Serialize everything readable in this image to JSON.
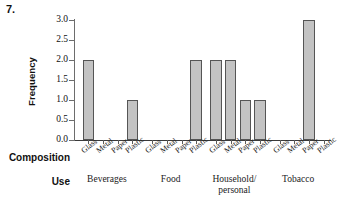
{
  "figure": {
    "number": "7."
  },
  "axes": {
    "y_title": "Frequency",
    "y_ticks": [
      "0.0",
      "0.5",
      "1.0",
      "1.5",
      "2.0",
      "2.5",
      "3.0"
    ],
    "row_label_composition": "Composition",
    "row_label_use": "Use"
  },
  "chart_data": {
    "type": "bar",
    "title": "",
    "xlabel": "Composition / Use",
    "ylabel": "Frequency",
    "ylim": [
      0,
      3.0
    ],
    "ytick_step": 0.5,
    "grid": false,
    "legend": "none",
    "bar_fill_color": "#c3c3c3",
    "bar_edge_color": "#555555",
    "categories": [
      "Glass",
      "Metal",
      "Paper",
      "Plastic"
    ],
    "groups": [
      "Beverages",
      "Food",
      "Household/personal",
      "Tobacco"
    ],
    "group_label_lines": [
      [
        "Beverages"
      ],
      [
        "Food"
      ],
      [
        "Household/",
        "personal"
      ],
      [
        "Tobacco"
      ]
    ],
    "series": [
      {
        "name": "Beverages",
        "values": [
          2,
          0,
          0,
          1
        ]
      },
      {
        "name": "Food",
        "values": [
          0,
          0,
          0,
          2
        ]
      },
      {
        "name": "Household/personal",
        "values": [
          2,
          2,
          1,
          1
        ]
      },
      {
        "name": "Tobacco",
        "values": [
          0,
          0,
          3,
          0
        ]
      }
    ],
    "points": [
      {
        "use": "Beverages",
        "composition": "Glass",
        "frequency": 2
      },
      {
        "use": "Beverages",
        "composition": "Metal",
        "frequency": 0
      },
      {
        "use": "Beverages",
        "composition": "Paper",
        "frequency": 0
      },
      {
        "use": "Beverages",
        "composition": "Plastic",
        "frequency": 1
      },
      {
        "use": "Food",
        "composition": "Glass",
        "frequency": 0
      },
      {
        "use": "Food",
        "composition": "Metal",
        "frequency": 0
      },
      {
        "use": "Food",
        "composition": "Paper",
        "frequency": 0
      },
      {
        "use": "Food",
        "composition": "Plastic",
        "frequency": 2
      },
      {
        "use": "Household/personal",
        "composition": "Glass",
        "frequency": 2
      },
      {
        "use": "Household/personal",
        "composition": "Metal",
        "frequency": 2
      },
      {
        "use": "Household/personal",
        "composition": "Paper",
        "frequency": 1
      },
      {
        "use": "Household/personal",
        "composition": "Plastic",
        "frequency": 1
      },
      {
        "use": "Tobacco",
        "composition": "Glass",
        "frequency": 0
      },
      {
        "use": "Tobacco",
        "composition": "Metal",
        "frequency": 0
      },
      {
        "use": "Tobacco",
        "composition": "Paper",
        "frequency": 3
      },
      {
        "use": "Tobacco",
        "composition": "Plastic",
        "frequency": 0
      }
    ]
  }
}
